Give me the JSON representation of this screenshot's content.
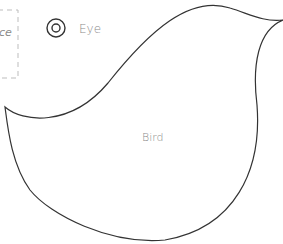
{
  "canvas": {
    "width": 283,
    "height": 244,
    "background": "#ffffff"
  },
  "shapes": {
    "partial_box": {
      "label": "ce",
      "border_color": "#bdbdbd",
      "border_style": "dashed"
    },
    "eye_legend": {
      "label": "Eye",
      "icon": "eye-icon",
      "stroke": "#333333"
    },
    "bird": {
      "label": "Bird",
      "stroke": "#333333",
      "fill": "#ffffff"
    }
  },
  "colors": {
    "stroke": "#333333",
    "text": "#8a8a8a",
    "dashed": "#bdbdbd"
  }
}
